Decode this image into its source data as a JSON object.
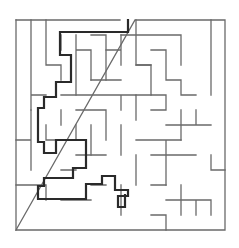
{
  "maze": {
    "wall_color": "#6a6a6a",
    "path_color": "#2a2a2a",
    "walls": [
      "M16 20 L120 20 M135 20 L225 20 L225 230 L16 230 Z",
      "M16 20 L16 230",
      "M31 20 L31 80 M31 95 L46 95 M31 80 L31 110 M46 20 L46 65 L61 65 L61 80",
      "M61 35 L61 50 M76 35 L76 95 M76 50 L91 50 M106 35 L91 35 M106 35 L106 80 M91 50 L91 80",
      "M136 20 L136 65 L151 65 L151 95 L166 95 L166 110 M166 110 L151 110",
      "M121 35 L181 35 L181 65 M151 50 L166 50 L166 80 L181 80 L181 95 L196 95 M211 20 L211 95",
      "M121 35 L121 65 M106 50 L121 50 M91 80 L121 80",
      "M61 95 L136 95 M121 95 L121 110 M136 95 L136 120 M76 110 L106 110 M106 110 L106 140 M61 110 L61 125",
      "M31 110 L31 170 M16 140 L31 140 M46 125 L46 140 L61 140 M76 125 L76 140 M91 125 L91 155 M121 125 L121 155",
      "M136 65 L151 65 M151 95 L136 95 M166 125 L211 125 M181 110 L181 140 M196 110 L196 125",
      "M136 140 L181 140 M151 155 L196 155 M136 155 L136 185 M211 155 L211 170 L225 170 M166 140 L166 185",
      "M16 185 L46 185 L46 200 M61 170 L76 170 M76 155 L106 155 M61 200 L91 200 M91 185 L106 185 M121 185 L121 215",
      "M151 185 L166 185 M166 200 L211 200 M181 185 L181 215 M196 200 L196 215 M151 215 L166 215 M166 215 L166 230 M211 200 L211 215"
    ],
    "solution_path": "M128 20 L128 32 L60 32 L60 55 L71 55 L71 82 L56 82 L56 97 L44 97 L44 108 L38 108 L38 142 L44 142 L44 153 L56 153 L56 140 L86 140 L86 168 L73 168 L73 178 L44 178 L44 186 L38 186 L38 199 L86 199 L86 184 L102 184 L102 176 L115 176 L115 190 L128 190 L128 196 L118 196 L118 207 L125 207 L125 195",
    "width": 239,
    "height": 248
  }
}
